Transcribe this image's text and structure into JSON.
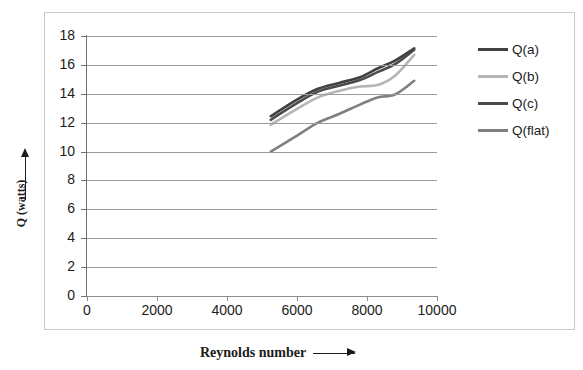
{
  "chart_data": {
    "type": "line",
    "title": "",
    "xlabel": "Reynolds number",
    "ylabel": "Q (watts)",
    "xlim": [
      0,
      10000
    ],
    "ylim": [
      0,
      18
    ],
    "xticks": [
      0,
      2000,
      4000,
      6000,
      8000,
      10000
    ],
    "yticks": [
      0,
      2,
      4,
      6,
      8,
      10,
      12,
      14,
      16,
      18
    ],
    "grid": "horizontal",
    "legend_position": "right",
    "series": [
      {
        "name": "Q(a)",
        "color": "#404040",
        "x": [
          5250,
          6000,
          6600,
          7200,
          7800,
          8300,
          8800,
          9350
        ],
        "y": [
          12.45,
          13.6,
          14.35,
          14.75,
          15.15,
          15.75,
          16.3,
          17.15
        ]
      },
      {
        "name": "Q(b)",
        "color": "#b5b5b5",
        "x": [
          5250,
          6000,
          6600,
          7200,
          7800,
          8300,
          8800,
          9350
        ],
        "y": [
          11.85,
          12.95,
          13.75,
          14.2,
          14.5,
          14.6,
          15.25,
          16.7
        ]
      },
      {
        "name": "Q(c)",
        "color": "#4a4a4a",
        "x": [
          5250,
          6000,
          6600,
          7200,
          7800,
          8300,
          8800,
          9350
        ],
        "y": [
          12.2,
          13.35,
          14.15,
          14.55,
          14.95,
          15.5,
          16.05,
          17.05
        ]
      },
      {
        "name": "Q(flat)",
        "color": "#808080",
        "x": [
          5250,
          6000,
          6600,
          7200,
          7800,
          8300,
          8800,
          9350
        ],
        "y": [
          10.0,
          11.1,
          12.0,
          12.6,
          13.25,
          13.75,
          13.95,
          14.9
        ]
      }
    ]
  },
  "axes": {
    "y_tick_labels": [
      "18",
      "16",
      "14",
      "12",
      "10",
      "8",
      "6",
      "4",
      "2",
      "0"
    ],
    "x_tick_labels": [
      "0",
      "2000",
      "4000",
      "6000",
      "8000",
      "10000"
    ],
    "y_title": "Q (watts)",
    "x_title": "Reynolds number"
  },
  "legend": {
    "items": [
      {
        "label": "Q(a)",
        "color": "#404040"
      },
      {
        "label": "Q(b)",
        "color": "#b5b5b5"
      },
      {
        "label": "Q(c)",
        "color": "#4a4a4a"
      },
      {
        "label": "Q(flat)",
        "color": "#808080"
      }
    ]
  }
}
